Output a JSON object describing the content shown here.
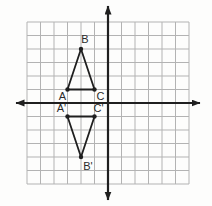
{
  "figure": {
    "grid": {
      "cell": 13.5,
      "cols_each_side": 6,
      "rows_each_side": 6,
      "color": "#b3b3b3",
      "background": "#fdfdfc"
    },
    "axes": {
      "color": "#1f1f1f",
      "origin_px": {
        "x": 108,
        "y": 103
      },
      "x_axis": {
        "from": 16,
        "to": 200
      },
      "y_axis": {
        "from": 6,
        "to": 200
      }
    },
    "style": {
      "line_color": "#1f1f1f",
      "line_width": 1.8,
      "axis_width": 2.2,
      "dot_radius": 2.2,
      "label_color": "#2b2b2b",
      "label_font_size": 11
    },
    "points": {
      "A": {
        "label": "A",
        "gx": -3,
        "gy": 1,
        "label_dx": -5,
        "label_dy": 10
      },
      "B": {
        "label": "B",
        "gx": -2,
        "gy": 4,
        "label_dx": 4,
        "label_dy": -6
      },
      "C": {
        "label": "C",
        "gx": -1,
        "gy": 1,
        "label_dx": 6,
        "label_dy": 10
      },
      "A2": {
        "label": "A'",
        "gx": -3,
        "gy": -1,
        "label_dx": -6,
        "label_dy": -5
      },
      "B2": {
        "label": "B'",
        "gx": -2,
        "gy": -4,
        "label_dx": 7,
        "label_dy": 13
      },
      "C2": {
        "label": "C'",
        "gx": -1,
        "gy": -1,
        "label_dx": 4,
        "label_dy": -5
      }
    },
    "triangles": [
      {
        "name": "triangle-ABC",
        "vertices": [
          "A",
          "B",
          "C"
        ]
      },
      {
        "name": "triangle-A-B-C-prime",
        "vertices": [
          "A2",
          "B2",
          "C2"
        ]
      }
    ]
  }
}
